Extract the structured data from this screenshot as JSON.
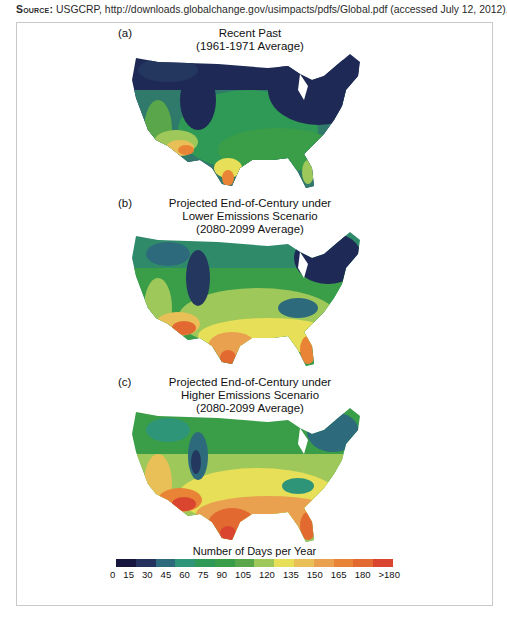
{
  "source": {
    "label": "Source:",
    "text": "USGCRP, http://downloads.globalchange.gov/usimpacts/pdfs/Global.pdf (accessed July 12, 2012)."
  },
  "panels": [
    {
      "letter": "(a)",
      "title_lines": [
        "Recent Past",
        "(1961-1971 Average)"
      ],
      "scenario": "recent"
    },
    {
      "letter": "(b)",
      "title_lines": [
        "Projected End-of-Century under",
        "Lower Emissions Scenario",
        "(2080-2099 Average)"
      ],
      "scenario": "lower"
    },
    {
      "letter": "(c)",
      "title_lines": [
        "Projected End-of-Century under",
        "Higher Emissions Scenario",
        "(2080-2099 Average)"
      ],
      "scenario": "higher"
    }
  ],
  "legend": {
    "title": "Number of Days per Year",
    "ticks": [
      "0",
      "15",
      "30",
      "45",
      "60",
      "75",
      "90",
      "105",
      "120",
      "135",
      "150",
      "165",
      "180",
      ">180"
    ],
    "colors": [
      "#16163f",
      "#25325d",
      "#2d6b7c",
      "#2f9579",
      "#2f9a55",
      "#3a9d48",
      "#5aa64a",
      "#9fc85a",
      "#e7df57",
      "#e9c058",
      "#eaa14f",
      "#e98437",
      "#e26a31",
      "#d9452e"
    ]
  },
  "chart_data": {
    "type": "heatmap",
    "maps": [
      {
        "label": "(a) Recent Past (1961-1971 Average)",
        "north": "0-30",
        "central_plains": "45-90",
        "southwest_desert": "120-180",
        "south_texas": "135-165",
        "florida": "105-135",
        "northeast": "0-15"
      },
      {
        "label": "(b) Projected End-of-Century under Lower Emissions Scenario (2080-2099 Average)",
        "north": "30-75",
        "central_plains": "75-120",
        "southwest_desert": "150->180",
        "south_texas": "150->180",
        "florida": "150-180",
        "northeast": "0-45"
      },
      {
        "label": "(c) Projected End-of-Century under Higher Emissions Scenario (2080-2099 Average)",
        "north": "45-90",
        "central_plains": "105-150",
        "southwest_desert": "165->180",
        "south_texas": ">180",
        "florida": "165->180",
        "northeast": "15-60"
      }
    ],
    "legend": {
      "title": "Number of Days per Year",
      "bins": [
        "0",
        "15",
        "30",
        "45",
        "60",
        "75",
        "90",
        "105",
        "120",
        "135",
        "150",
        "165",
        "180",
        ">180"
      ]
    }
  }
}
